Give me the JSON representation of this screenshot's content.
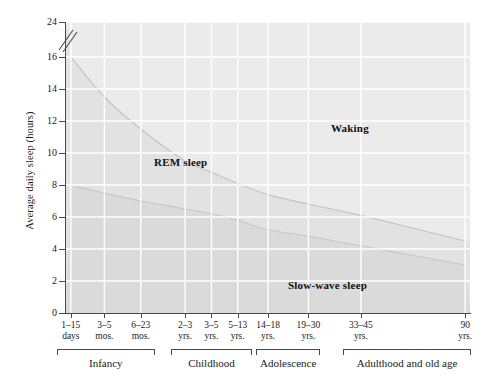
{
  "chart_data": {
    "type": "area",
    "title": "",
    "xlabel": "",
    "ylabel": "Average daily sleep (hours)",
    "ylim": [
      0,
      24
    ],
    "grid": true,
    "legend_position": "inline-area-labels",
    "note": "Stacked area chart of daily sleep composition across the human lifespan. Total bar height is 24 h (full day); the y-axis is broken between 16 and 24.",
    "y_ticks": [
      {
        "value": 0,
        "label": "0"
      },
      {
        "value": 2,
        "label": "2"
      },
      {
        "value": 4,
        "label": "4"
      },
      {
        "value": 6,
        "label": "6"
      },
      {
        "value": 8,
        "label": "8"
      },
      {
        "value": 10,
        "label": "10"
      },
      {
        "value": 12,
        "label": "12"
      },
      {
        "value": 14,
        "label": "14"
      },
      {
        "value": 16,
        "label": "16"
      },
      {
        "value": 24,
        "label": "24"
      }
    ],
    "axis_break": {
      "between": [
        16,
        24
      ],
      "symbol": "double-slash"
    },
    "categories": [
      "1–15 days",
      "3–5 mos.",
      "6–23 mos.",
      "2–3 yrs.",
      "3–5 yrs.",
      "5–13 yrs.",
      "14–18 yrs.",
      "19–30 yrs.",
      "33–45 yrs.",
      "90 yrs."
    ],
    "category_lines": [
      {
        "l1": "1–15",
        "l2": "days"
      },
      {
        "l1": "3–5",
        "l2": "mos."
      },
      {
        "l1": "6–23",
        "l2": "mos."
      },
      {
        "l1": "2–3",
        "l2": "yrs."
      },
      {
        "l1": "3–5",
        "l2": "yrs."
      },
      {
        "l1": "5–13",
        "l2": "yrs."
      },
      {
        "l1": "14–18",
        "l2": "yrs."
      },
      {
        "l1": "19–30",
        "l2": "yrs."
      },
      {
        "l1": "33–45",
        "l2": "yrs."
      },
      {
        "l1": "90",
        "l2": "yrs."
      }
    ],
    "series": [
      {
        "name": "Slow-wave sleep",
        "label": "Slow-wave sleep",
        "values": [
          8.0,
          7.5,
          7.0,
          6.5,
          6.2,
          5.8,
          5.2,
          4.8,
          4.2,
          3.0
        ]
      },
      {
        "name": "REM sleep",
        "label": "REM sleep",
        "values": [
          8.0,
          6.0,
          4.5,
          3.0,
          2.6,
          2.3,
          2.2,
          2.0,
          1.9,
          1.5
        ]
      },
      {
        "name": "Waking",
        "label": "Waking",
        "values": [
          8.0,
          10.5,
          12.5,
          14.5,
          15.2,
          15.9,
          16.6,
          17.2,
          17.9,
          19.5
        ]
      }
    ],
    "cumulative_boundaries": {
      "slow_wave_top": [
        8.0,
        7.5,
        7.0,
        6.5,
        6.2,
        5.8,
        5.2,
        4.8,
        4.2,
        3.0
      ],
      "rem_top": [
        16.0,
        13.5,
        11.5,
        9.5,
        8.8,
        8.1,
        7.4,
        6.8,
        6.1,
        4.5
      ],
      "total": [
        24,
        24,
        24,
        24,
        24,
        24,
        24,
        24,
        24,
        24
      ]
    },
    "area_labels": [
      {
        "name": "rem",
        "text": "REM sleep"
      },
      {
        "name": "waking",
        "text": "Waking"
      },
      {
        "name": "sws",
        "text": "Slow-wave sleep"
      }
    ],
    "life_stages": [
      {
        "name": "infancy",
        "label": "Infancy",
        "from_category": "1–15 days",
        "to_category": "6–23 mos."
      },
      {
        "name": "childhood",
        "label": "Childhood",
        "from_category": "2–3 yrs.",
        "to_category": "5–13 yrs."
      },
      {
        "name": "adolescence",
        "label": "Adolescence",
        "from_category": "14–18 yrs.",
        "to_category": "19–30 yrs."
      },
      {
        "name": "adulthood",
        "label": "Adulthood and old age",
        "from_category": "33–45 yrs.",
        "to_category": "90 yrs."
      }
    ],
    "colors": {
      "plot_fill": "#e3e3e3",
      "gridline": "#ffffff",
      "axis": "#4a4a4a",
      "text": "#1a1a1a",
      "waking_band": "#e9e9e9",
      "rem_band": "#e1e1e1",
      "slow_wave_band": "#d9d9d9"
    }
  }
}
